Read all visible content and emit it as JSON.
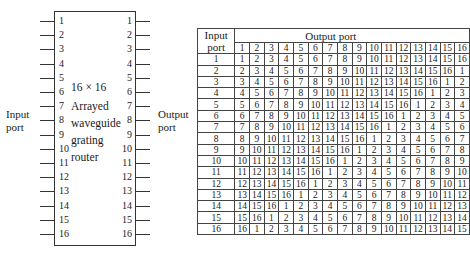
{
  "diagram": {
    "box_text": [
      "16 × 16",
      "Arrayed",
      "waveguide",
      "grating",
      "router"
    ],
    "input_label": [
      "Input",
      "port"
    ],
    "output_label": [
      "Output",
      "port"
    ],
    "input_ports": [
      "1",
      "2",
      "3",
      "4",
      "5",
      "6",
      "7",
      "8",
      "9",
      "10",
      "11",
      "12",
      "13",
      "14",
      "15",
      "16"
    ],
    "output_ports": [
      "1",
      "2",
      "3",
      "4",
      "5",
      "6",
      "7",
      "8",
      "9",
      "10",
      "11",
      "12",
      "13",
      "14",
      "15",
      "16"
    ]
  },
  "table": {
    "corner_header": [
      "Input",
      "port"
    ],
    "output_header": "Output port",
    "columns": [
      "1",
      "2",
      "3",
      "4",
      "5",
      "6",
      "7",
      "8",
      "9",
      "10",
      "11",
      "12",
      "13",
      "14",
      "15",
      "16"
    ],
    "rows": [
      {
        "input": "1",
        "values": [
          1,
          2,
          3,
          4,
          5,
          6,
          7,
          8,
          9,
          10,
          11,
          12,
          13,
          14,
          15,
          16
        ]
      },
      {
        "input": "2",
        "values": [
          2,
          3,
          4,
          5,
          6,
          7,
          8,
          9,
          10,
          11,
          12,
          13,
          14,
          15,
          16,
          1
        ]
      },
      {
        "input": "3",
        "values": [
          3,
          4,
          5,
          6,
          7,
          8,
          9,
          10,
          11,
          12,
          13,
          14,
          15,
          16,
          1,
          2
        ]
      },
      {
        "input": "4",
        "values": [
          4,
          5,
          6,
          7,
          8,
          9,
          10,
          11,
          12,
          13,
          14,
          15,
          16,
          1,
          2,
          3
        ]
      },
      {
        "input": "5",
        "values": [
          5,
          6,
          7,
          8,
          9,
          10,
          11,
          12,
          13,
          14,
          15,
          16,
          1,
          2,
          3,
          4
        ]
      },
      {
        "input": "6",
        "values": [
          6,
          7,
          8,
          9,
          10,
          11,
          12,
          13,
          14,
          15,
          16,
          1,
          2,
          3,
          4,
          5
        ]
      },
      {
        "input": "7",
        "values": [
          7,
          8,
          9,
          10,
          11,
          12,
          13,
          14,
          15,
          16,
          1,
          2,
          3,
          4,
          5,
          6
        ]
      },
      {
        "input": "8",
        "values": [
          8,
          9,
          10,
          11,
          12,
          13,
          14,
          15,
          16,
          1,
          2,
          3,
          4,
          5,
          6,
          7
        ]
      },
      {
        "input": "9",
        "values": [
          9,
          10,
          11,
          12,
          13,
          14,
          15,
          16,
          1,
          2,
          3,
          4,
          5,
          6,
          7,
          8
        ]
      },
      {
        "input": "10",
        "values": [
          10,
          11,
          12,
          13,
          14,
          15,
          16,
          1,
          2,
          3,
          4,
          5,
          6,
          7,
          8,
          9
        ]
      },
      {
        "input": "11",
        "values": [
          11,
          12,
          13,
          14,
          15,
          16,
          1,
          2,
          3,
          4,
          5,
          6,
          7,
          8,
          9,
          10
        ]
      },
      {
        "input": "12",
        "values": [
          12,
          13,
          14,
          15,
          16,
          1,
          2,
          3,
          4,
          5,
          6,
          7,
          8,
          9,
          10,
          11
        ]
      },
      {
        "input": "13",
        "values": [
          13,
          14,
          15,
          16,
          1,
          2,
          3,
          4,
          5,
          6,
          7,
          8,
          9,
          10,
          11,
          12
        ]
      },
      {
        "input": "14",
        "values": [
          14,
          15,
          16,
          1,
          2,
          3,
          4,
          5,
          6,
          7,
          8,
          9,
          10,
          11,
          12,
          13
        ]
      },
      {
        "input": "15",
        "values": [
          15,
          16,
          1,
          2,
          3,
          4,
          5,
          6,
          7,
          8,
          9,
          10,
          11,
          12,
          13,
          14
        ]
      },
      {
        "input": "16",
        "values": [
          16,
          1,
          2,
          3,
          4,
          5,
          6,
          7,
          8,
          9,
          10,
          11,
          12,
          13,
          14,
          15
        ]
      }
    ]
  }
}
